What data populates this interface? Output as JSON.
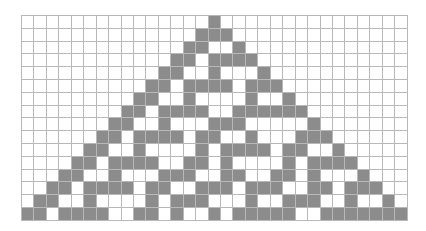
{
  "diagram": {
    "type": "cellular-automaton",
    "rule": 30,
    "columns": 31,
    "rows": 16,
    "colors": {
      "on": "#8c8c8c",
      "off": "#ffffff",
      "gridline": "#b8b8b8"
    },
    "cells": [
      "0000000000000001000000000000000",
      "0000000000000011100000000000000",
      "0000000000000110010000000000000",
      "0000000000001101111000000000000",
      "0000000000011001000100000000000",
      "0000000000110111101110000000000",
      "0000000001100100001001000000000",
      "0000000011011110011111100000000",
      "0000000110010001110000010000000",
      "0000001101111011001000111000000",
      "0000011001000010111101100100000",
      "0000110111100110100001011110000",
      "0001100100011100110011010001000",
      "0011011110110011101110011011100",
      "0110010000101110001001110010010",
      "1101111001101001011111001111111"
    ]
  }
}
